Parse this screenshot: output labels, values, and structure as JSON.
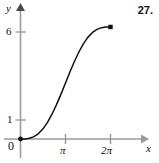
{
  "figure": {
    "problem_number": "27.",
    "axes": {
      "y_axis_label": "y",
      "x_axis_label": "x",
      "origin_label": "0"
    },
    "y_ticks": [
      {
        "label": "6",
        "value": 6
      },
      {
        "label": "1",
        "value": 1
      }
    ],
    "x_ticks": [
      {
        "label": "π",
        "value": 3.1416
      },
      {
        "label": "2π",
        "value": 6.2832
      }
    ],
    "colors": {
      "axis": "#9a9a9a",
      "curve": "#111111",
      "point": "#111111",
      "text": "#111111",
      "background": "#ffffff"
    }
  },
  "chart_data": {
    "type": "line",
    "title": "",
    "xlabel": "x",
    "ylabel": "y",
    "xlim": [
      0,
      6.9
    ],
    "ylim": [
      0,
      7.2
    ],
    "grid": false,
    "legend": null,
    "xticks": [
      0,
      3.1416,
      6.2832
    ],
    "xticklabels": [
      "0",
      "π",
      "2π"
    ],
    "yticks": [
      0,
      1,
      6
    ],
    "yticklabels": [
      "0",
      "1",
      "6"
    ],
    "series": [
      {
        "name": "y = x - sin x",
        "x": [
          0,
          0.3142,
          0.6283,
          0.9425,
          1.2566,
          1.5708,
          1.885,
          2.1991,
          2.5133,
          2.8274,
          3.1416,
          3.4558,
          3.7699,
          4.0841,
          4.3982,
          4.7124,
          5.0265,
          5.3407,
          5.6549,
          5.969,
          6.2832
        ],
        "y": [
          0,
          0.0051,
          0.0403,
          0.1334,
          0.3056,
          0.5708,
          0.9339,
          1.3903,
          1.9255,
          2.5166,
          3.1416,
          3.7665,
          4.3576,
          4.8928,
          5.3492,
          5.7124,
          5.9775,
          6.1498,
          6.2429,
          6.2781,
          6.2832
        ]
      }
    ],
    "endpoints": [
      {
        "name": "start-point",
        "x": 0,
        "y": 0,
        "style": "filled"
      },
      {
        "name": "end-point",
        "x": 6.2832,
        "y": 6.2832,
        "style": "filled"
      }
    ],
    "annotations": []
  }
}
